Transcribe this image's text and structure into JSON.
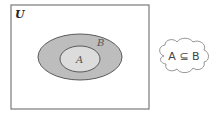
{
  "diagram": {
    "universe_label": "U",
    "outer_set_label": "B",
    "inner_set_label": "A",
    "relation_text": "A ⊆ B",
    "colors": {
      "border": "#7a7a7a",
      "outer_fill": "#bdbdbd",
      "inner_fill": "#dcdcdc",
      "ellipse_stroke": "#5a5a5a"
    }
  }
}
